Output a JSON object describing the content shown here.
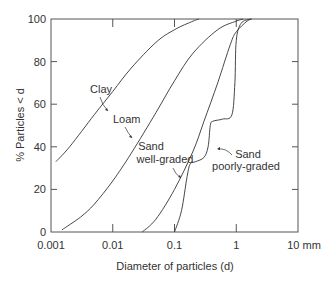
{
  "chart_data": {
    "type": "line",
    "title": "",
    "xlabel": "Diameter of particles (d)",
    "ylabel": "% Particles < d",
    "xscale": "log",
    "xlim": [
      0.001,
      10
    ],
    "ylim": [
      0,
      100
    ],
    "x_unit": "mm",
    "x_ticks": [
      "0.001",
      "0.01",
      "0.1",
      "1",
      "10"
    ],
    "x_tick_unit_suffix": "mm",
    "y_ticks": [
      "0",
      "20",
      "40",
      "60",
      "80",
      "100"
    ],
    "grid": false,
    "legend": "inline annotations",
    "series": [
      {
        "name": "Clay",
        "points": [
          [
            0.0012,
            33
          ],
          [
            0.002,
            40
          ],
          [
            0.005,
            55
          ],
          [
            0.01,
            66
          ],
          [
            0.02,
            77
          ],
          [
            0.05,
            89
          ],
          [
            0.1,
            95
          ],
          [
            0.2,
            99
          ],
          [
            0.25,
            100
          ]
        ]
      },
      {
        "name": "Loam",
        "points": [
          [
            0.0015,
            1
          ],
          [
            0.003,
            7
          ],
          [
            0.005,
            13
          ],
          [
            0.01,
            24
          ],
          [
            0.02,
            37
          ],
          [
            0.05,
            56
          ],
          [
            0.1,
            71
          ],
          [
            0.2,
            84
          ],
          [
            0.5,
            95
          ],
          [
            1.0,
            99
          ],
          [
            1.3,
            100
          ]
        ]
      },
      {
        "name": "Sand well-graded",
        "points": [
          [
            0.03,
            0
          ],
          [
            0.05,
            6
          ],
          [
            0.1,
            20
          ],
          [
            0.2,
            38
          ],
          [
            0.3,
            52
          ],
          [
            0.5,
            70
          ],
          [
            0.8,
            88
          ],
          [
            1.0,
            94
          ],
          [
            1.5,
            99
          ],
          [
            1.8,
            100
          ]
        ]
      },
      {
        "name": "Sand poorly-graded",
        "points": [
          [
            0.1,
            0
          ],
          [
            0.13,
            10
          ],
          [
            0.16,
            26
          ],
          [
            0.18,
            32
          ],
          [
            0.22,
            33
          ],
          [
            0.3,
            35
          ],
          [
            0.35,
            40
          ],
          [
            0.38,
            50
          ],
          [
            0.42,
            52
          ],
          [
            0.6,
            53
          ],
          [
            0.85,
            55
          ],
          [
            0.95,
            70
          ],
          [
            1.0,
            90
          ],
          [
            1.2,
            98
          ],
          [
            1.7,
            100
          ]
        ]
      }
    ],
    "annotations": [
      {
        "text": "Clay",
        "for": "Clay"
      },
      {
        "text": "Loam",
        "for": "Loam"
      },
      {
        "text": "Sand",
        "for": "Sand well-graded",
        "line": 1
      },
      {
        "text": "well-graded",
        "for": "Sand well-graded",
        "line": 2
      },
      {
        "text": "Sand",
        "for": "Sand poorly-graded",
        "line": 1
      },
      {
        "text": "poorly-graded",
        "for": "Sand poorly-graded",
        "line": 2
      }
    ]
  },
  "labels": {
    "ylabel": "% Particles < d",
    "xlabel": "Diameter of particles (d)",
    "clay": "Clay",
    "loam": "Loam",
    "sand_wg_1": "Sand",
    "sand_wg_2": "well-graded",
    "sand_pg_1": "Sand",
    "sand_pg_2": "poorly-graded",
    "x_ticks": [
      "0.001",
      "0.01",
      "0.1",
      "1",
      "10 mm"
    ],
    "y_ticks": [
      "0",
      "20",
      "40",
      "60",
      "80",
      "100"
    ]
  }
}
